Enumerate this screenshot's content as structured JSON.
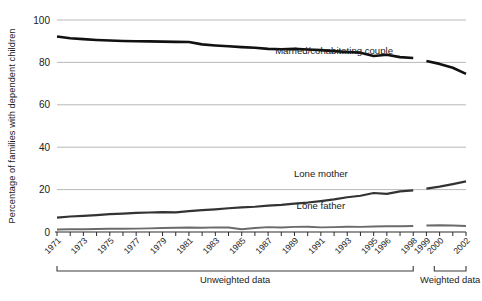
{
  "chart_data": {
    "type": "line",
    "title": "",
    "subtitle": "",
    "xlabel": "",
    "ylabel": "Percentage of families with dependent children",
    "ylim": [
      0,
      100
    ],
    "yticks": [
      0,
      20,
      40,
      60,
      80,
      100
    ],
    "ytick_labels": [
      "0",
      "20",
      "40",
      "60",
      "80",
      "100"
    ],
    "grid": true,
    "legend": "inline-annotations",
    "x": [
      1971,
      1972,
      1973,
      1974,
      1975,
      1976,
      1977,
      1978,
      1979,
      1980,
      1981,
      1982,
      1983,
      1984,
      1985,
      1986,
      1987,
      1988,
      1989,
      1990,
      1991,
      1992,
      1993,
      1994,
      1995,
      1996,
      1997,
      1998,
      1999,
      2000,
      2001,
      2002
    ],
    "xtick_labels": [
      "1971",
      "1973",
      "1975",
      "1977",
      "1979",
      "1981",
      "1983",
      "1985",
      "1987",
      "1989",
      "1991",
      "1993",
      "1995",
      "1996",
      "1998",
      "1999",
      "2000",
      "2002"
    ],
    "xtick_values": [
      1971,
      1973,
      1975,
      1977,
      1979,
      1981,
      1983,
      1985,
      1987,
      1989,
      1991,
      1993,
      1995,
      1996,
      1998,
      1999,
      2000,
      2002
    ],
    "minor_tick_values": [
      1971,
      1972,
      1973,
      1974,
      1975,
      1976,
      1977,
      1978,
      1979,
      1980,
      1981,
      1982,
      1983,
      1984,
      1985,
      1986,
      1987,
      1988,
      1989,
      1990,
      1991,
      1992,
      1993,
      1994,
      1995,
      1996,
      1997,
      1998,
      1999,
      2000,
      2001,
      2002
    ],
    "break_between": [
      1998,
      1999
    ],
    "series": [
      {
        "name": "Married/cohabitating couple",
        "color": "#111111",
        "label_x": 1992,
        "label_y": 84,
        "values": [
          92.2,
          91.4,
          91.0,
          90.6,
          90.3,
          90.1,
          90.0,
          89.9,
          89.8,
          89.7,
          89.6,
          88.5,
          88.0,
          87.6,
          87.2,
          86.9,
          86.4,
          86.2,
          86.4,
          86.1,
          85.8,
          85.3,
          84.9,
          84.6,
          83.0,
          83.6,
          82.5,
          82.1,
          80.7,
          79.3,
          77.5,
          74.6
        ]
      },
      {
        "name": "Lone mother",
        "color": "#333333",
        "label_x": 1991,
        "label_y": 26,
        "values": [
          6.8,
          7.3,
          7.6,
          8.0,
          8.4,
          8.7,
          9.0,
          9.2,
          9.4,
          9.3,
          9.8,
          10.3,
          10.7,
          11.2,
          11.6,
          11.9,
          12.4,
          12.8,
          13.4,
          13.9,
          14.6,
          15.4,
          16.4,
          17.1,
          18.4,
          18.0,
          19.2,
          19.6,
          20.5,
          21.4,
          22.6,
          23.9
        ]
      },
      {
        "name": "Lone father",
        "color": "#6b6b6b",
        "label_x": 1991,
        "label_y": 11,
        "values": [
          1.2,
          1.3,
          1.3,
          1.4,
          1.5,
          1.5,
          1.6,
          1.7,
          1.9,
          2.0,
          2.1,
          2.0,
          2.2,
          2.1,
          1.3,
          1.9,
          2.3,
          2.1,
          2.4,
          2.5,
          2.2,
          2.3,
          2.5,
          2.4,
          2.6,
          2.7,
          2.7,
          2.8,
          3.1,
          3.2,
          3.1,
          2.8
        ]
      }
    ],
    "range_brackets": [
      {
        "label": "Unweighted data",
        "from": 1971,
        "to": 1998
      },
      {
        "label": "Weighted data",
        "from": 1999.6,
        "to": 2002
      }
    ]
  }
}
